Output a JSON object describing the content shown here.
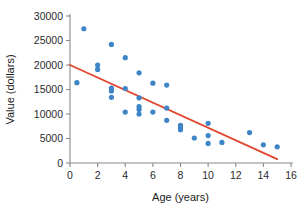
{
  "chart_data": {
    "type": "scatter",
    "title": "",
    "xlabel": "Age (years)",
    "ylabel": "Value (dollars)",
    "xlim": [
      0,
      16
    ],
    "ylim": [
      0,
      30000
    ],
    "xticks": [
      0,
      2,
      4,
      6,
      8,
      10,
      12,
      14,
      16
    ],
    "xtick_labels": [
      "0",
      "2",
      "4",
      "6",
      "8",
      "10",
      "12",
      "14",
      "16"
    ],
    "yticks": [
      0,
      5000,
      10000,
      15000,
      20000,
      25000,
      30000
    ],
    "ytick_labels": [
      "0",
      "5000",
      "10000",
      "15000",
      "20000",
      "25000",
      "30000"
    ],
    "grid": false,
    "legend": false,
    "point_color": "#3d85c6",
    "line_color": "#e2472e",
    "axis_color": "#8a8a8a",
    "points": [
      {
        "x": 0.5,
        "y": 16400
      },
      {
        "x": 1.0,
        "y": 27400
      },
      {
        "x": 2.0,
        "y": 20000
      },
      {
        "x": 2.0,
        "y": 19100
      },
      {
        "x": 3.0,
        "y": 24200
      },
      {
        "x": 3.0,
        "y": 15300
      },
      {
        "x": 3.0,
        "y": 14700
      },
      {
        "x": 3.0,
        "y": 13400
      },
      {
        "x": 4.0,
        "y": 21500
      },
      {
        "x": 4.0,
        "y": 15200
      },
      {
        "x": 4.0,
        "y": 10400
      },
      {
        "x": 5.0,
        "y": 18400
      },
      {
        "x": 5.0,
        "y": 13300
      },
      {
        "x": 5.0,
        "y": 11500
      },
      {
        "x": 5.0,
        "y": 10900
      },
      {
        "x": 5.0,
        "y": 10000
      },
      {
        "x": 6.0,
        "y": 16300
      },
      {
        "x": 6.0,
        "y": 10400
      },
      {
        "x": 7.0,
        "y": 15900
      },
      {
        "x": 7.0,
        "y": 11200
      },
      {
        "x": 7.0,
        "y": 8700
      },
      {
        "x": 8.0,
        "y": 7700
      },
      {
        "x": 8.0,
        "y": 7200
      },
      {
        "x": 8.0,
        "y": 6800
      },
      {
        "x": 9.0,
        "y": 5100
      },
      {
        "x": 10.0,
        "y": 8100
      },
      {
        "x": 10.0,
        "y": 5600
      },
      {
        "x": 10.0,
        "y": 4000
      },
      {
        "x": 11.0,
        "y": 4200
      },
      {
        "x": 13.0,
        "y": 6200
      },
      {
        "x": 14.0,
        "y": 3700
      },
      {
        "x": 15.0,
        "y": 3300
      }
    ],
    "fit_line": {
      "name": "least-squares regression line",
      "x_start": 0.0,
      "y_start": 20000,
      "x_end": 15.0,
      "y_end": 800
    }
  }
}
